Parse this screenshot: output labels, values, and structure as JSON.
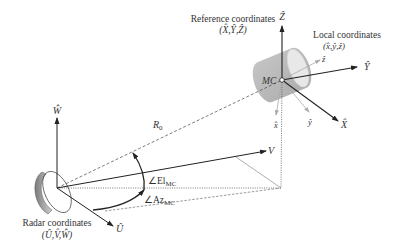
{
  "diagram": {
    "reference_frame": {
      "title": "Reference coordinates",
      "axes": "(X̂,Ŷ,Ẑ)",
      "x_axis": "X̂",
      "y_axis": "Ŷ",
      "z_axis": "Ẑ"
    },
    "local_frame": {
      "title": "Local coordinates",
      "axes": "(x̂,ŷ,ẑ)",
      "x_axis": "x̂",
      "y_axis": "ŷ",
      "z_axis": "ẑ"
    },
    "radar_frame": {
      "title": "Radar coordinates",
      "axes": "(Û,V̂,Ŵ)",
      "u_axis": "Û",
      "v_axis": "V",
      "w_axis": "Ŵ"
    },
    "target_label": "MC",
    "range_label": "R",
    "range_subscript": "0",
    "elevation_label": "∠El",
    "elevation_subscript": "MC",
    "azimuth_label": "∠Az",
    "azimuth_subscript": "MC",
    "colors": {
      "line": "#222222",
      "text": "#333333",
      "cylinder": "#bdbdbd",
      "cylinder_cap": "#e6e6e6",
      "dish": "#9a9a9a"
    }
  }
}
